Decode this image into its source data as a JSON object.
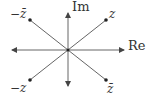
{
  "diagram": {
    "axes": {
      "real_label": "Re",
      "imag_label": "Im"
    },
    "points": [
      {
        "id": "z",
        "label": "z",
        "quadrant": "I"
      },
      {
        "id": "neg_conj_z",
        "label": "−z̄",
        "quadrant": "II"
      },
      {
        "id": "neg_z",
        "label": "−z",
        "quadrant": "III"
      },
      {
        "id": "conj_z",
        "label": "z̄",
        "quadrant": "IV"
      }
    ],
    "colors": {
      "line": "#555555",
      "text": "#333333"
    }
  }
}
